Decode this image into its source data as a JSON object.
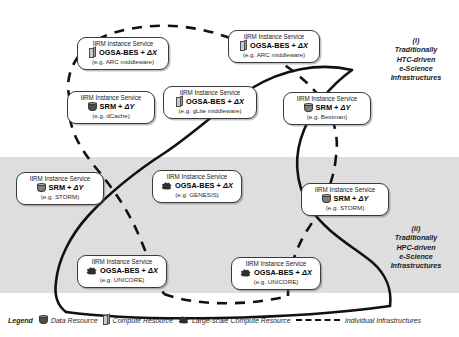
{
  "diagram": {
    "regions": [
      {
        "id": "htc",
        "marker": "(i)",
        "line1": "Traditionally",
        "line2": "HTC-driven",
        "line3": "e-Science",
        "line4": "Infrastructures"
      },
      {
        "id": "hpc",
        "marker": "(ii)",
        "line1": "Traditionally",
        "line2": "HPC-driven",
        "line3": "e-Science",
        "line4": "Infrastructures"
      }
    ],
    "nodes": [
      {
        "id": "arc",
        "title": "IIRM Instance Service",
        "interface": "OGSA-BES + ",
        "delta": "ΔX",
        "example": "(e.g. ARC middleware)",
        "icon": "compute-resource-icon"
      },
      {
        "id": "arc2",
        "title": "IIRM Instance Service",
        "interface": "OGSA-BES + ",
        "delta": "ΔX",
        "example": "(e.g. ARC middleware)",
        "icon": "compute-resource-icon"
      },
      {
        "id": "dcache",
        "title": "IIRM Instance Service",
        "interface": "SRM + ",
        "delta": "ΔY",
        "example": "(e.g. dCache)",
        "icon": "data-resource-icon"
      },
      {
        "id": "glite",
        "title": "IIRM Instance Service",
        "interface": "OGSA-BES + ",
        "delta": "ΔX",
        "example": "(e.g. gLite middleware)",
        "icon": "compute-resource-icon"
      },
      {
        "id": "bestman",
        "title": "IIRM Instance Service",
        "interface": "SRM + ",
        "delta": "ΔY",
        "example": "(e.g. Bestman)",
        "icon": "data-resource-icon"
      },
      {
        "id": "storm-left",
        "title": "IIRM Instance Service",
        "interface": "SRM + ",
        "delta": "ΔY",
        "example": "(e.g. STORM)",
        "icon": "data-resource-icon"
      },
      {
        "id": "genesis",
        "title": "IIRM Instance Service",
        "interface": "OGSA-BES + ",
        "delta": "ΔX",
        "example": "(e.g. GENESIS)",
        "icon": "large-scale-compute-resource-icon"
      },
      {
        "id": "storm-right",
        "title": "IIRM Instance Service",
        "interface": "SRM + ",
        "delta": "ΔY",
        "example": "(e.g. STORM)",
        "icon": "data-resource-icon"
      },
      {
        "id": "unicore-left",
        "title": "IIRM Instance Service",
        "interface": "OGSA-BES + ",
        "delta": "ΔX",
        "example": "(e.g. UNICORE)",
        "icon": "large-scale-compute-resource-icon"
      },
      {
        "id": "unicore-right",
        "title": "IIRM Instance Service",
        "interface": "OGSA-BES + ",
        "delta": "ΔX",
        "example": "(e.g. UNICORE)",
        "icon": "large-scale-compute-resource-icon"
      }
    ],
    "legend": {
      "title": "Legend",
      "items": [
        {
          "id": "data",
          "label": "Data Resource",
          "icon": "data-resource-icon"
        },
        {
          "id": "compute",
          "label": "Compute Resource",
          "icon": "compute-resource-icon"
        },
        {
          "id": "large",
          "label": "Large-scale Compute Resource",
          "icon": "large-scale-compute-resource-icon"
        },
        {
          "id": "infra",
          "label": "Individual Infrastructures",
          "icon": "dashed-line-icon"
        }
      ]
    },
    "colors": {
      "band": "#dedede",
      "outline": "#3a3a3a",
      "box_fill": "#ffffff",
      "data_icon": "#4d4d4d",
      "compute_icon": "#c9c9c9",
      "large_icon": "#333333"
    }
  }
}
